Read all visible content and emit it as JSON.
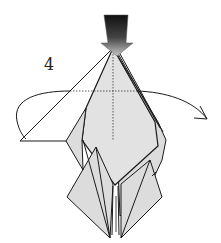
{
  "diagram": {
    "step_number": "4",
    "instruction_symbols": [
      "push-down-arrow",
      "turn-over-arrow",
      "valley-fold-lines"
    ],
    "colors": {
      "paper": "#dcdcdc",
      "paper_light": "#e6e6e6",
      "outline": "#1a1a1a",
      "arrow_dark": "#111111",
      "arrow_light": "#bdbdbd",
      "background": "#ffffff"
    }
  }
}
